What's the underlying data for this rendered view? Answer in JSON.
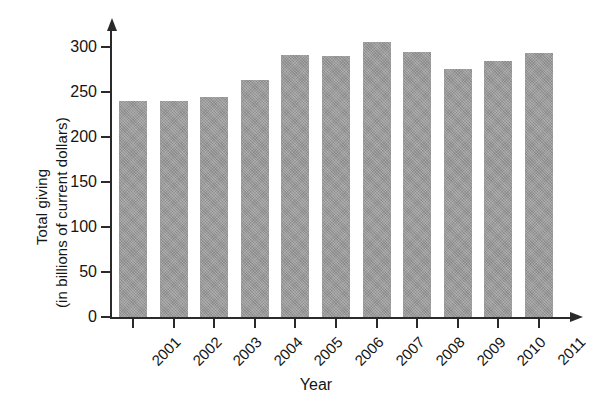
{
  "chart_data": {
    "type": "bar",
    "title": "",
    "xlabel": "Year",
    "ylabel_line1": "Total giving",
    "ylabel_line2": "(in billions of current dollars)",
    "ylabel": "Total giving (in billions of current dollars)",
    "categories": [
      "2001",
      "2002",
      "2003",
      "2004",
      "2005",
      "2006",
      "2007",
      "2008",
      "2009",
      "2010",
      "2011"
    ],
    "values": [
      240,
      240,
      245,
      263,
      291,
      290,
      306,
      295,
      276,
      285,
      293
    ],
    "ylim": [
      0,
      320
    ],
    "yticks": [
      0,
      50,
      100,
      150,
      200,
      250,
      300
    ],
    "ytick_labels": [
      "0",
      "50",
      "100",
      "150",
      "200",
      "250",
      "300"
    ],
    "grid": false,
    "legend": false,
    "bar_color": "#9c9c9c",
    "axis_color": "#2a2a2a",
    "background_color": "#ffffff"
  }
}
